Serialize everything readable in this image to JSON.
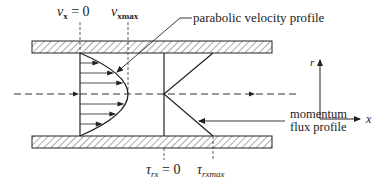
{
  "diagram": {
    "labels": {
      "vx_zero_sym": "v",
      "vx_zero_sub": "x",
      "vx_zero_eq": " = 0",
      "vx_max_sym": "v",
      "vx_max_sub": "xmax",
      "velocity_profile": "parabolic velocity profile",
      "momentum_line1": "momentum",
      "momentum_line2": "flux profile",
      "tau_zero_sym": "τ",
      "tau_zero_sub": "rx",
      "tau_zero_eq": " = 0",
      "tau_max_sym": "τ",
      "tau_max_sub": "rxmax",
      "axis_r": "r",
      "axis_x": "x"
    },
    "colors": {
      "ink": "#222222",
      "background": "#ffffff"
    }
  }
}
